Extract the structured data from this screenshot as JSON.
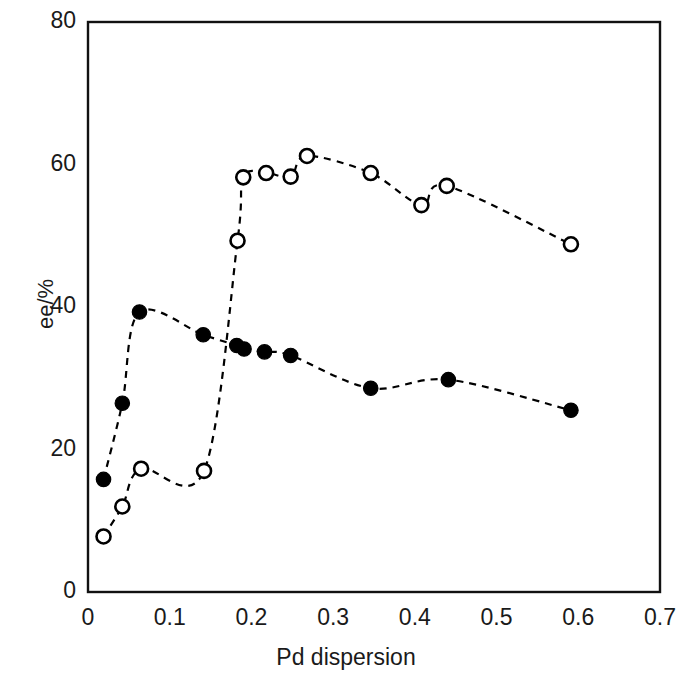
{
  "chart_data": {
    "type": "scatter",
    "title": "",
    "xlabel": "Pd dispersion",
    "ylabel": "ee/%",
    "xlim": [
      0,
      0.7
    ],
    "ylim": [
      0,
      80
    ],
    "xticks": [
      "0",
      "0.1",
      "0.2",
      "0.3",
      "0.4",
      "0.5",
      "0.6",
      "0.7"
    ],
    "xtick_values": [
      0,
      0.1,
      0.2,
      0.3,
      0.4,
      0.5,
      0.6,
      0.7
    ],
    "yticks": [
      "0",
      "20",
      "40",
      "60",
      "80"
    ],
    "ytick_values": [
      0,
      20,
      40,
      60,
      80
    ],
    "grid": false,
    "legend": "none",
    "frame": "box",
    "series": [
      {
        "name": "open-circles",
        "marker": "open-circle",
        "color": "#000000",
        "line": "dashed",
        "x": [
          0.019,
          0.042,
          0.065,
          0.142,
          0.183,
          0.19,
          0.218,
          0.248,
          0.268,
          0.346,
          0.408,
          0.439,
          0.591
        ],
        "y": [
          7.8,
          12.0,
          17.3,
          17.0,
          49.3,
          58.2,
          58.8,
          58.3,
          61.2,
          58.8,
          54.3,
          57.0,
          48.8
        ]
      },
      {
        "name": "filled-circles",
        "marker": "filled-circle",
        "color": "#000000",
        "line": "dashed",
        "x": [
          0.019,
          0.042,
          0.063,
          0.141,
          0.182,
          0.191,
          0.216,
          0.248,
          0.346,
          0.441,
          0.591
        ],
        "y": [
          15.8,
          26.5,
          39.3,
          36.1,
          34.6,
          34.1,
          33.7,
          33.2,
          28.6,
          29.8,
          25.5
        ]
      }
    ]
  }
}
